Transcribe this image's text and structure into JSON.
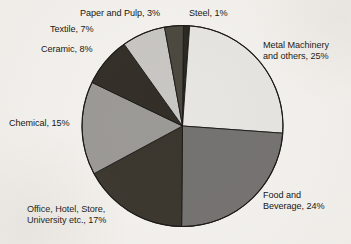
{
  "chart_data": {
    "type": "pie",
    "title": "",
    "subtitle": "",
    "xlabel": "",
    "ylabel": "",
    "legend_position": "none",
    "grid": false,
    "unit": "%",
    "categories": [
      "Steel",
      "Metal Machinery and others",
      "Food and Beverage",
      "Office, Hotel, Store, University etc.",
      "Chemical",
      "Ceramic",
      "Textile",
      "Paper and Pulp"
    ],
    "values": [
      1,
      25,
      24,
      17,
      15,
      8,
      7,
      3
    ],
    "colors": [
      "#2b2822",
      "#e7e6e2",
      "#757371",
      "#3b372f",
      "#9c9a96",
      "#332f28",
      "#c9c7c3",
      "#4b4840"
    ],
    "slices": [
      {
        "label": "Steel, 1%",
        "name": "Steel",
        "value": 1,
        "color": "#2b2822"
      },
      {
        "label": "Metal Machinery and others, 25%",
        "name": "Metal Machinery and others",
        "value": 25,
        "color": "#e7e6e2"
      },
      {
        "label": "Food and Beverage, 24%",
        "name": "Food and Beverage",
        "value": 24,
        "color": "#757371"
      },
      {
        "label": "Office, Hotel, Store, University etc., 17%",
        "name": "Office, Hotel, Store, University etc.",
        "value": 17,
        "color": "#3b372f"
      },
      {
        "label": "Chemical, 15%",
        "name": "Chemical",
        "value": 15,
        "color": "#9c9a96"
      },
      {
        "label": "Ceramic, 8%",
        "name": "Ceramic",
        "value": 8,
        "color": "#332f28"
      },
      {
        "label": "Textile, 7%",
        "name": "Textile",
        "value": 7,
        "color": "#c9c7c3"
      },
      {
        "label": "Paper and Pulp, 3%",
        "name": "Paper and Pulp",
        "value": 3,
        "color": "#4b4840"
      }
    ]
  },
  "labels": {
    "paper_and_pulp": "Paper and Pulp, 3%",
    "steel": "Steel, 1%",
    "textile": "Textile, 7%",
    "ceramic": "Ceramic, 8%",
    "chemical": "Chemical, 15%",
    "office": "Office, Hotel, Store,\nUniversity etc., 17%",
    "metal_machinery": "Metal Machinery\nand others, 25%",
    "food_and_beverage": "Food and\nBeverage, 24%"
  },
  "style": {
    "background": "#f5f3ef",
    "text_color": "#15130f",
    "outline_color": "#1a1814"
  }
}
